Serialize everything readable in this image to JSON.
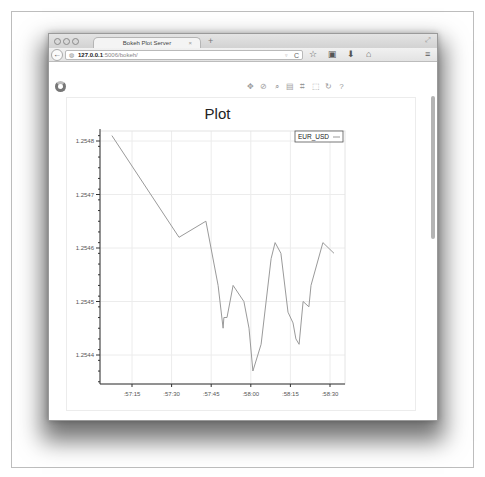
{
  "browser": {
    "tab_title": "Bokeh Plot Server",
    "tab_close": "×",
    "new_tab": "+",
    "url_host": "127.0.0.1",
    "url_rest": ":5006/bokeh/",
    "icons": {
      "back": "←",
      "globe": "◍",
      "dropdown": "▿",
      "reload": "C",
      "bookmark_star": "☆",
      "bookmarks_list": "▣",
      "downloads": "⬇",
      "home": "⌂",
      "menu": "≡",
      "resize": "⤢"
    }
  },
  "toolbar": {
    "tools": [
      {
        "name": "pan-tool",
        "glyph": "✥"
      },
      {
        "name": "wheel-zoom-tool",
        "glyph": "⊘"
      },
      {
        "name": "box-zoom-tool",
        "glyph": "⌕"
      },
      {
        "name": "save-tool",
        "glyph": "▤"
      },
      {
        "name": "resize-tool",
        "glyph": "⌗"
      },
      {
        "name": "box-select-tool",
        "glyph": "⬚"
      },
      {
        "name": "reset-tool",
        "glyph": "↻"
      },
      {
        "name": "help-tool",
        "glyph": "?"
      }
    ]
  },
  "chart_data": {
    "type": "line",
    "title": "Plot",
    "xlabel": "",
    "ylabel": "",
    "legend": [
      {
        "label": "EUR_USD",
        "position": "top_right"
      }
    ],
    "grid": true,
    "x_tick_labels": [
      ":57:15",
      ":57:30",
      ":57:45",
      ":58:00",
      ":58:15",
      ":58:30"
    ],
    "y_tick_labels": [
      "1.2548",
      "1.2547",
      "1.2546",
      "1.2545",
      "1.2544"
    ],
    "ylim": [
      1.25433,
      1.25485
    ],
    "series": [
      {
        "name": "EUR_USD",
        "color": "#9a9a9a",
        "x": [
          ":57:07",
          ":57:33",
          ":57:43",
          ":57:48",
          ":57:49.5",
          ":57:50",
          ":57:51",
          ":57:53",
          ":57:57",
          ":57:59",
          ":58:01",
          ":58:04",
          ":58:08",
          ":58:09",
          ":58:11",
          ":58:14",
          ":58:16",
          ":58:17",
          ":58:18",
          ":58:20",
          ":58:22",
          ":58:23",
          ":58:27",
          ":58:31"
        ],
        "x_seconds": [
          7.4,
          32.8,
          43,
          47.6,
          49.5,
          49.8,
          51,
          53.3,
          57.4,
          59.3,
          60.8,
          63.9,
          67.7,
          69.2,
          71.4,
          74.1,
          76,
          77.1,
          78.3,
          79.8,
          82,
          82.8,
          87.3,
          91.5
        ],
        "values": [
          1.25481,
          1.25462,
          1.25465,
          1.25453,
          1.25445,
          1.25447,
          1.25447,
          1.25453,
          1.2545,
          1.25445,
          1.25437,
          1.25442,
          1.25458,
          1.25461,
          1.25459,
          1.25448,
          1.25446,
          1.25443,
          1.25442,
          1.2545,
          1.25449,
          1.25453,
          1.25461,
          1.25459
        ]
      }
    ]
  }
}
